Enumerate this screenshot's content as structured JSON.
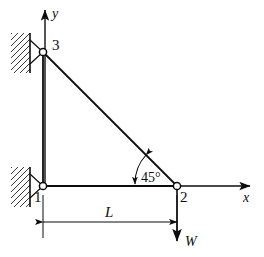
{
  "figure": {
    "type": "structural-truss-free-body-diagram",
    "background_color": "#ffffff",
    "stroke_color": "#0d0d0d",
    "axes": {
      "x_label": "x",
      "y_label": "y",
      "origin_node": "1"
    },
    "nodes": [
      {
        "id": "3",
        "label": "3",
        "x": 43,
        "y": 52,
        "support": "pin",
        "label_dx": 9,
        "label_dy": -2
      },
      {
        "id": "1",
        "label": "1",
        "x": 43,
        "y": 186,
        "support": "pin",
        "label_dx": -9,
        "label_dy": 16
      },
      {
        "id": "2",
        "label": "2",
        "x": 177,
        "y": 186,
        "support": "none",
        "label_dx": 3,
        "label_dy": 16
      }
    ],
    "members": [
      {
        "from": "3",
        "to": "1",
        "orientation": "vertical"
      },
      {
        "from": "1",
        "to": "2",
        "orientation": "horizontal"
      },
      {
        "from": "3",
        "to": "2",
        "orientation": "diagonal"
      }
    ],
    "angle_annotation": {
      "label": "45°",
      "value": 45,
      "unit": "degrees",
      "at_node": "2",
      "between": "member 1-2 and member 3-2"
    },
    "dimension": {
      "label": "L",
      "from_node": "1",
      "to_node": "2",
      "orientation": "horizontal"
    },
    "load": {
      "label": "W",
      "at_node": "2",
      "direction": "downward"
    },
    "supports": {
      "hatching": "diagonal-wall-hatch",
      "count": 2
    }
  }
}
